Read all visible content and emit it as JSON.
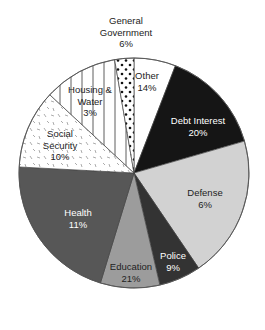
{
  "chart_data": {
    "type": "pie",
    "title": "",
    "center": [
      134,
      173
    ],
    "radius": 115,
    "slices": [
      {
        "label": "Other",
        "value": "14%",
        "start_angle": -90,
        "end_angle": -68.9,
        "fill": "#ffffff",
        "pattern": "none",
        "text_color": "#222222",
        "label_pos": [
          147,
          79
        ]
      },
      {
        "label": "Debt Interest",
        "value": "20%",
        "start_angle": -68.9,
        "end_angle": -16.1,
        "fill": "#151515",
        "pattern": "none",
        "text_color": "#ffffff",
        "label_pos": [
          198,
          124
        ]
      },
      {
        "label": "Defense",
        "value": "6%",
        "start_angle": -16.1,
        "end_angle": 55.8,
        "fill": "#d2d2d2",
        "pattern": "none",
        "text_color": "#222222",
        "label_pos": [
          205,
          196
        ]
      },
      {
        "label": "Police",
        "value": "9%",
        "start_angle": 55.8,
        "end_angle": 77,
        "fill": "#333333",
        "pattern": "none",
        "text_color": "#ffffff",
        "label_pos": [
          173,
          259
        ]
      },
      {
        "label": "Education",
        "value": "21%",
        "start_angle": 77,
        "end_angle": 107,
        "fill": "#9c9c9c",
        "pattern": "none",
        "text_color": "#222222",
        "label_pos": [
          131,
          270
        ]
      },
      {
        "label": "Health",
        "value": "11%",
        "start_angle": 107,
        "end_angle": 183,
        "fill": "#575757",
        "pattern": "none",
        "text_color": "#ffffff",
        "label_pos": [
          78,
          216
        ]
      },
      {
        "label": "Social Security",
        "value": "10%",
        "start_angle": 183,
        "end_angle": 222.9,
        "fill": "#ffffff",
        "pattern": "dashes",
        "text_color": "#222222",
        "label_pos": [
          60,
          137
        ]
      },
      {
        "label": "Housing & Water",
        "value": "3%",
        "start_angle": 222.9,
        "end_angle": 260.3,
        "fill": "#ffffff",
        "pattern": "vlines",
        "text_color": "#222222",
        "label_pos": [
          90,
          93
        ]
      },
      {
        "label": "General Government",
        "value": "6%",
        "start_angle": 260.3,
        "end_angle": 270,
        "fill": "#ffffff",
        "pattern": "dots",
        "text_color": "#222222",
        "label_pos": [
          126,
          24
        ]
      }
    ],
    "label_lines": {
      "Other": [
        "Other",
        "14%"
      ],
      "Debt Interest": [
        "Debt Interest",
        "20%"
      ],
      "Defense": [
        "Defense",
        "6%"
      ],
      "Police": [
        "Police",
        "9%"
      ],
      "Education": [
        "Education",
        "21%"
      ],
      "Health": [
        "Health",
        "11%"
      ],
      "Social Security": [
        "Social",
        "Security",
        "10%"
      ],
      "Housing & Water": [
        "Housing &",
        "Water",
        "3%"
      ],
      "General Government": [
        "General",
        "Government",
        "6%"
      ]
    },
    "legend": "none",
    "xlabel": "",
    "ylabel": ""
  }
}
